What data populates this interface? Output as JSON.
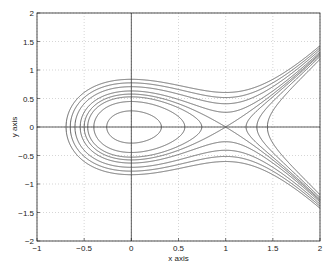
{
  "chart_data": {
    "type": "line",
    "title": "",
    "xlabel": "x axis",
    "ylabel": "y axis",
    "xlim": [
      -1,
      2
    ],
    "ylim": [
      -2,
      2
    ],
    "grid": true,
    "legend": null,
    "x_ticks": [
      "-1",
      "-0.5",
      "0",
      "0.5",
      "1",
      "1.5",
      "2"
    ],
    "y_ticks": [
      "-2",
      "-1.5",
      "-1",
      "-0.5",
      "0",
      "0.5",
      "1",
      "1.5",
      "2"
    ],
    "series": [
      {
        "name": "H=0.04",
        "level": 0.04
      },
      {
        "name": "H=0.10",
        "level": 0.1
      },
      {
        "name": "H=0.14",
        "level": 0.14
      },
      {
        "name": "separatrix H=1/6",
        "level": 0.1667
      },
      {
        "name": "H=0.20",
        "level": 0.2
      },
      {
        "name": "H=0.25",
        "level": 0.25
      },
      {
        "name": "H=0.30",
        "level": 0.3
      },
      {
        "name": "H=0.35",
        "level": 0.35
      }
    ],
    "line_color": "#555555",
    "grid_color": "#bbbbbb",
    "axis_color": "#222222"
  }
}
